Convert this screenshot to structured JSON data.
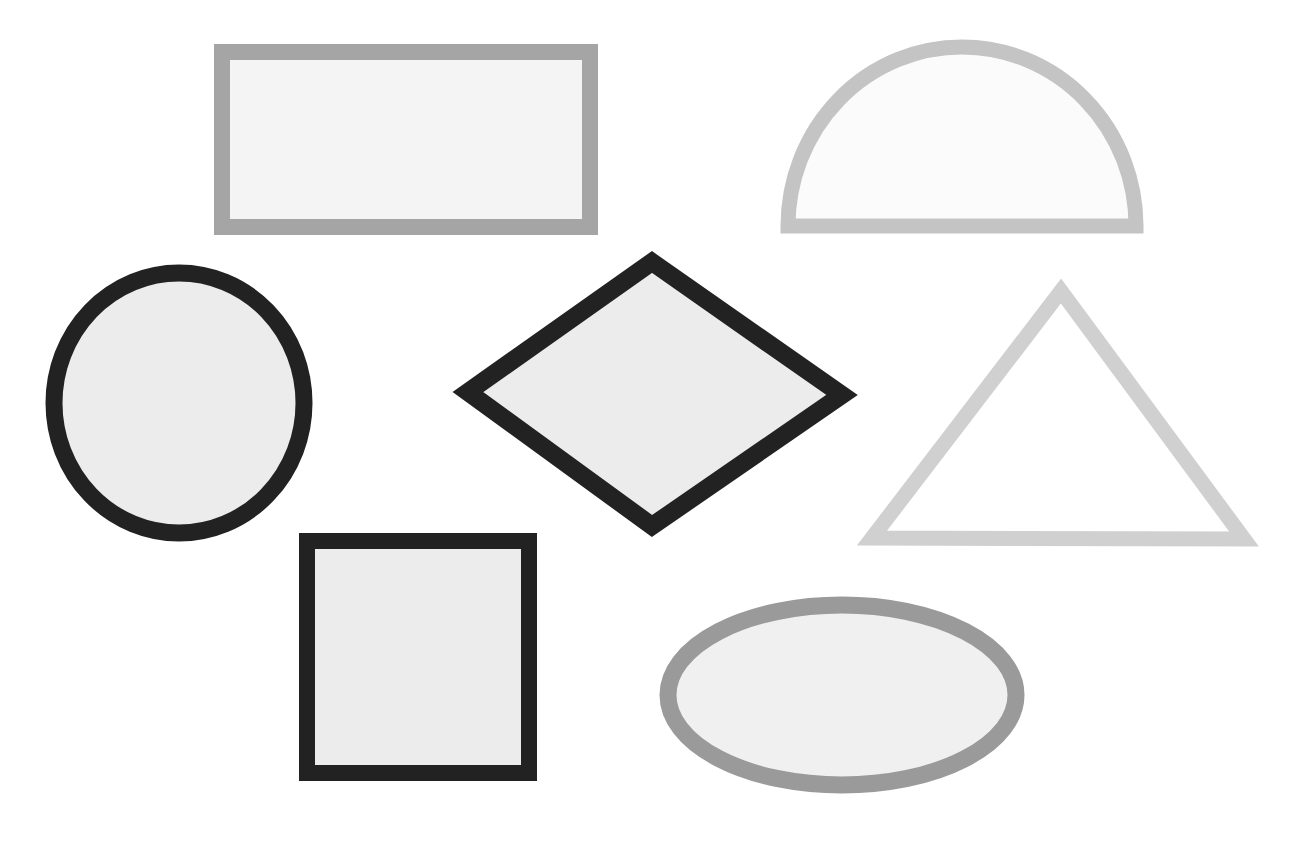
{
  "canvas": {
    "width": 1315,
    "height": 847,
    "background": "#ffffff"
  },
  "shapes": [
    {
      "name": "rectangle",
      "type": "rect",
      "x": 222,
      "y": 52,
      "w": 368,
      "h": 175,
      "stroke": "#a5a5a5",
      "stroke_width": 16,
      "fill": "#f4f4f4"
    },
    {
      "name": "semicircle",
      "type": "path",
      "d": "M 788 226 A 174 179 0 0 1 1136 226 Z",
      "stroke": "#c4c4c4",
      "stroke_width": 15,
      "fill": "#fbfbfb"
    },
    {
      "name": "circle",
      "type": "ellipse",
      "cx": 179,
      "cy": 403,
      "rx": 125,
      "ry": 130,
      "stroke": "#222222",
      "stroke_width": 17,
      "fill": "#ececec"
    },
    {
      "name": "diamond",
      "type": "polygon",
      "points": "652,262 842,395 652,526 468,392",
      "stroke": "#222222",
      "stroke_width": 18,
      "fill": "#ececec"
    },
    {
      "name": "triangle",
      "type": "polygon",
      "points": "1061,291 1244,539 872,538",
      "stroke": "#d0d0d0",
      "stroke_width": 15,
      "fill": "#ffffff"
    },
    {
      "name": "square",
      "type": "rect",
      "x": 307,
      "y": 541,
      "w": 222,
      "h": 232,
      "stroke": "#222222",
      "stroke_width": 16,
      "fill": "#ececec"
    },
    {
      "name": "oval",
      "type": "ellipse",
      "cx": 842,
      "cy": 695,
      "rx": 174,
      "ry": 90,
      "stroke": "#9a9a9a",
      "stroke_width": 17,
      "fill": "#f0f0f0"
    }
  ]
}
